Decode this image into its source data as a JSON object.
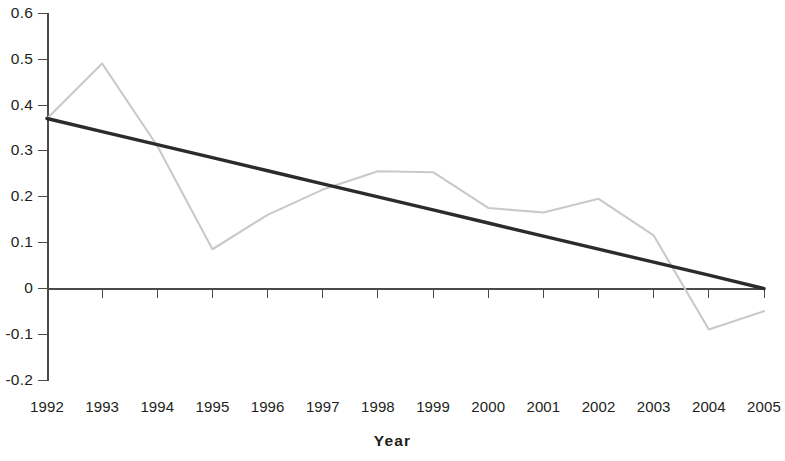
{
  "chart_data": {
    "type": "line",
    "title": "",
    "xlabel": "Year",
    "ylabel": "",
    "x": [
      1992,
      1993,
      1994,
      1995,
      1996,
      1997,
      1998,
      1999,
      2000,
      2001,
      2002,
      2003,
      2004,
      2005
    ],
    "categories": [
      "1992",
      "1993",
      "1994",
      "1995",
      "1996",
      "1997",
      "1998",
      "1999",
      "2000",
      "2001",
      "2002",
      "2003",
      "2004",
      "2005"
    ],
    "xlim": [
      1992,
      2005
    ],
    "ylim": [
      -0.2,
      0.6
    ],
    "ytick_labels": [
      "0.6",
      "0.5",
      "0.4",
      "0.3",
      "0.2",
      "0.1",
      "0",
      "-0.1",
      "-0.2"
    ],
    "ytick_values": [
      0.6,
      0.5,
      0.4,
      0.3,
      0.2,
      0.1,
      0,
      -0.1,
      -0.2
    ],
    "grid": false,
    "legend": "none",
    "zero_line": true,
    "series": [
      {
        "name": "data",
        "color": "#c9c9c9",
        "style": "line",
        "values": [
          0.37,
          0.49,
          0.31,
          0.085,
          0.16,
          0.215,
          0.255,
          0.253,
          0.175,
          0.165,
          0.195,
          0.115,
          -0.09,
          -0.05
        ]
      },
      {
        "name": "trend",
        "color": "#2b2b2b",
        "style": "linear-trend",
        "values": [
          0.37,
          0.3415,
          0.313,
          0.2846,
          0.2561,
          0.2276,
          0.1992,
          0.1707,
          0.1422,
          0.1138,
          0.0853,
          0.0568,
          0.0284,
          -0.0007
        ]
      }
    ],
    "axis_color": "#4a4a4a"
  }
}
